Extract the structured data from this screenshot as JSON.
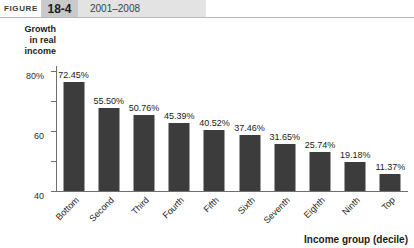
{
  "header": {
    "figure_word": "FIGURE",
    "figure_number": "18-4",
    "figure_title": "2001–2008"
  },
  "chart_data": {
    "type": "bar",
    "title": "2001–2008",
    "xlabel": "Income group (decile)",
    "ylabel": "Growth in real income",
    "ylabel_lines": [
      "Growth",
      "in real",
      "income"
    ],
    "categories": [
      "Bottom",
      "Second",
      "Third",
      "Fourth",
      "Fifth",
      "Sixth",
      "Seventh",
      "Eighth",
      "Ninth",
      "Top"
    ],
    "values": [
      72.45,
      55.5,
      50.76,
      45.39,
      40.52,
      37.46,
      31.65,
      25.74,
      19.18,
      11.37
    ],
    "value_labels": [
      "72.45%",
      "55.50%",
      "50.76%",
      "45.39%",
      "40.52%",
      "37.46%",
      "31.65%",
      "25.74%",
      "19.18%",
      "11.37%"
    ],
    "ylim": [
      0,
      80
    ],
    "yticks": [
      0,
      20,
      40,
      60,
      80
    ],
    "ytick_labels": [
      "0",
      "20",
      "40",
      "60",
      "80%"
    ],
    "grid": false,
    "legend": null,
    "bar_color": "#3c3c3c",
    "axis_color": "#6f6f6f",
    "label_rotation": -45
  }
}
